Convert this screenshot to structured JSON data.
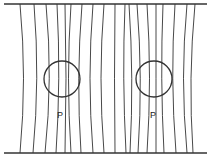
{
  "figure": {
    "labels": [
      {
        "text": "P",
        "x": 58,
        "y": 111
      },
      {
        "text": "P",
        "x": 151,
        "y": 111
      }
    ],
    "caption": "",
    "colors": {
      "line": "#333333",
      "background": "#ffffff"
    }
  }
}
